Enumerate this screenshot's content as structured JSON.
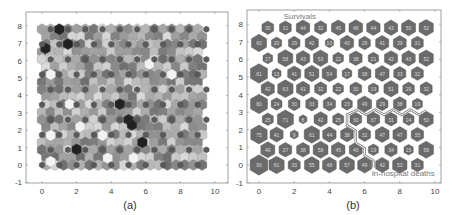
{
  "chart_data": [
    {
      "type": "heatmap",
      "panel_label": "(a)",
      "title": "",
      "description": "Self-organizing map U-matrix (hexagonal grid, grayscale distances)",
      "xlabel": "",
      "ylabel": "",
      "xlim": [
        -1,
        10.5
      ],
      "ylim": [
        -1,
        8.7
      ],
      "xticks": [
        "0",
        "2",
        "4",
        "6",
        "8",
        "10"
      ],
      "yticks": [
        "-1",
        "0",
        "1",
        "2",
        "3",
        "4",
        "5",
        "6",
        "7",
        "8"
      ],
      "grid": false,
      "grid_size": {
        "cols": 10,
        "rows": 10
      },
      "colormap": "gray"
    },
    {
      "type": "heatmap",
      "panel_label": "(b)",
      "title": "",
      "description": "SOM hit map: hexagon size proportional to hit count; cluster boundary separates survivals (top-left) from in-hospital deaths (bottom-right)",
      "xlabel": "",
      "ylabel": "",
      "xlim": [
        -1,
        10.5
      ],
      "ylim": [
        -1,
        8.7
      ],
      "xticks": [
        "0",
        "2",
        "4",
        "6",
        "8",
        "10"
      ],
      "yticks": [
        "-1",
        "0",
        "1",
        "2",
        "3",
        "4",
        "5",
        "6",
        "7",
        "8"
      ],
      "grid": false,
      "annotations": [
        "Survivals",
        "In-hospital deaths"
      ],
      "rows_top_to_bottom": [
        [
          30,
          31,
          44,
          32,
          45,
          46,
          44,
          43,
          50,
          52
        ],
        [
          60,
          20,
          29,
          42,
          10,
          43,
          29,
          41,
          39,
          31
        ],
        [
          17,
          58,
          43,
          53,
          22,
          38,
          21,
          42,
          43,
          52
        ],
        [
          81,
          13,
          41,
          51,
          54,
          17,
          38,
          47,
          33,
          32
        ],
        [
          42,
          63,
          41,
          32,
          22,
          30,
          19,
          51,
          29,
          32
        ],
        [
          80,
          24,
          30,
          33,
          34,
          23,
          49,
          29,
          38,
          19
        ],
        [
          25,
          71,
          8,
          42,
          25,
          30,
          37,
          31,
          24,
          50
        ],
        [
          75,
          41,
          9,
          61,
          44,
          38,
          32,
          47,
          47,
          35
        ],
        [
          49,
          37,
          38,
          58,
          45,
          40,
          19,
          34,
          15,
          56
        ],
        [
          90,
          61,
          33,
          55,
          48,
          57,
          49,
          42,
          53,
          31
        ]
      ]
    }
  ],
  "panels": {
    "a": {
      "caption": "(a)"
    },
    "b": {
      "caption": "(b)",
      "label_top": "Survivals",
      "label_bottom": "In-hospital deaths"
    }
  },
  "colors": {
    "hex_fill": "#6b6b6b",
    "hex_stroke": "#4a4a4a",
    "boundary": "#777777",
    "axis": "#555555"
  }
}
